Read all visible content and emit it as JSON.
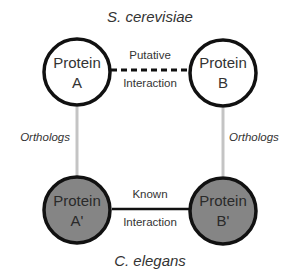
{
  "diagram": {
    "top_species": "S. cerevisiae",
    "bottom_species": "C. elegans",
    "nodes": [
      {
        "id": "A",
        "line1": "Protein",
        "line2": "A",
        "fill": "#ffffff"
      },
      {
        "id": "B",
        "line1": "Protein",
        "line2": "B",
        "fill": "#ffffff"
      },
      {
        "id": "A_prime",
        "line1": "Protein",
        "line2": "A'",
        "fill": "#858585"
      },
      {
        "id": "B_prime",
        "line1": "Protein",
        "line2": "B'",
        "fill": "#858585"
      }
    ],
    "edges": {
      "putative": {
        "line1": "Putative",
        "line2": "Interaction",
        "style": "dashed"
      },
      "known": {
        "line1": "Known",
        "line2": "Interaction",
        "style": "solid"
      },
      "orthologs_left": {
        "label": "Orthologs",
        "style": "gray"
      },
      "orthologs_right": {
        "label": "Orthologs",
        "style": "gray"
      }
    },
    "colors": {
      "stroke": "#111111",
      "ortholog_line": "#c4c4c4",
      "text": "#333333",
      "elegans_fill": "#858585"
    }
  }
}
